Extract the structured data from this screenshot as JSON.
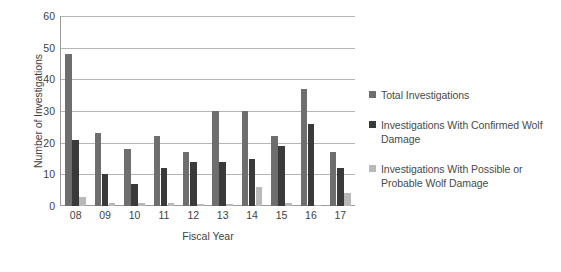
{
  "chart_data": {
    "type": "bar",
    "title": "",
    "xlabel": "Fiscal Year",
    "ylabel": "Number of Investigations",
    "categories": [
      "08",
      "09",
      "10",
      "11",
      "12",
      "13",
      "14",
      "15",
      "16",
      "17"
    ],
    "ylim": [
      0,
      60
    ],
    "yticks": [
      0,
      10,
      20,
      30,
      40,
      50,
      60
    ],
    "grid": true,
    "legend_position": "right",
    "series": [
      {
        "name": "Total Investigations",
        "color": "#6e6e6e",
        "values": [
          48,
          23,
          18,
          22,
          17,
          30,
          30,
          22,
          37,
          17
        ]
      },
      {
        "name": "Investigations With Confirmed Wolf Damage",
        "color": "#3a3a3a",
        "values": [
          21,
          10,
          7,
          12,
          14,
          14,
          15,
          19,
          26,
          12
        ]
      },
      {
        "name": "Investigations With Possible or Probable Wolf Damage",
        "color": "#b9b9b9",
        "values": [
          3,
          1,
          1,
          1,
          0.5,
          0.5,
          6,
          1,
          0.3,
          4
        ]
      }
    ]
  },
  "axes": {
    "y_title": "Number of Investigations",
    "x_title": "Fiscal Year",
    "y_tick_labels": [
      "60",
      "50",
      "40",
      "30",
      "20",
      "10",
      "0"
    ],
    "x_tick_labels": [
      "08",
      "09",
      "10",
      "11",
      "12",
      "13",
      "14",
      "15",
      "16",
      "17"
    ]
  },
  "legend": {
    "entries": [
      {
        "label": "Total Investigations",
        "swatch_color": "#6e6e6e",
        "swatch_name": "legend-swatch-total"
      },
      {
        "label": "Investigations With Confirmed Wolf Damage",
        "swatch_color": "#3a3a3a",
        "swatch_name": "legend-swatch-confirmed"
      },
      {
        "label": "Investigations With Possible or Probable Wolf Damage",
        "swatch_color": "#b9b9b9",
        "swatch_name": "legend-swatch-possible"
      }
    ]
  },
  "colors": {
    "background": "#ffffff",
    "axis": "#9a9a9a",
    "gridline": "#b5b5b5",
    "text": "#3f3f3f",
    "series_total": "#6e6e6e",
    "series_confirmed": "#3a3a3a",
    "series_possible": "#b9b9b9"
  }
}
